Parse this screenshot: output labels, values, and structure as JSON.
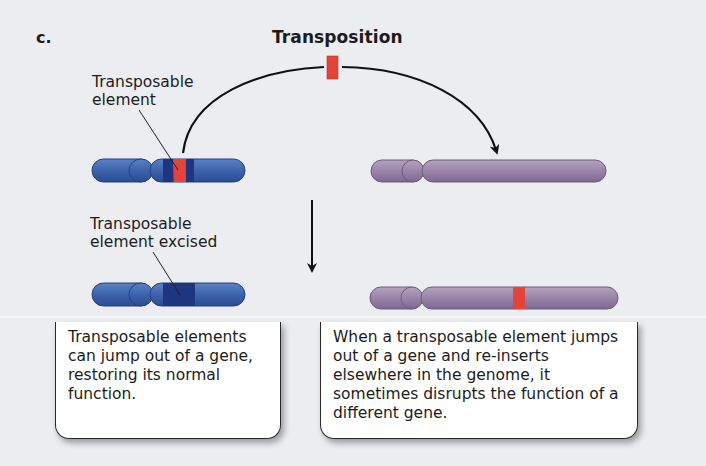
{
  "figure": {
    "panel_label": "c.",
    "title": "Transposition",
    "labels": {
      "transposable_element": "Transposable\nelement",
      "transposable_element_excised": "Transposable\nelement excised"
    },
    "callouts": {
      "left": "Transposable elements can jump out of a gene, restoring its normal function.",
      "right": "When a transposable element jumps out of a gene and re-inserts elsewhere in the genome, it sometimes disrupts the function of a different gene."
    },
    "colors": {
      "background": "#ecedf0",
      "chromosome_blue": "#3d63ad",
      "chromosome_blue_dark": "#1f3580",
      "chromosome_purple": "#9a85a8",
      "transposon_red": "#e2433a",
      "arrow": "#111111"
    }
  }
}
